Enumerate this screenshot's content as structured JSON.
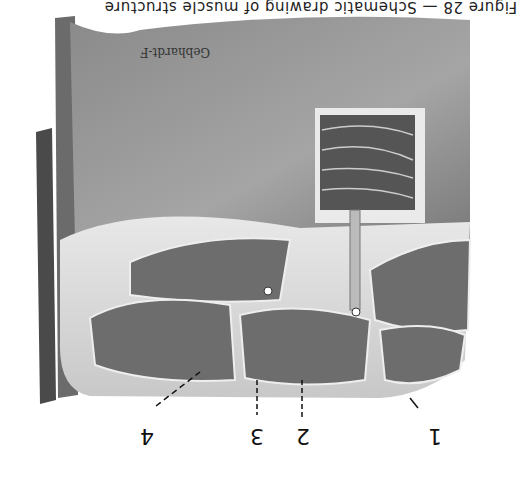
{
  "caption": "Figure 28 — Schematic drawing of muscle structure",
  "signature": "Gebhardt-F",
  "labels": [
    {
      "id": "1",
      "text": "1"
    },
    {
      "id": "2",
      "text": "2"
    },
    {
      "id": "3",
      "text": "3"
    },
    {
      "id": "4",
      "text": "4"
    }
  ],
  "orientation": "rotated 180 degrees"
}
